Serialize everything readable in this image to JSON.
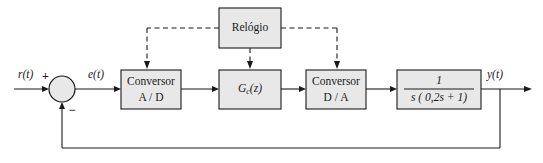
{
  "diagram": {
    "language": "pt-BR",
    "colors": {
      "block_fill": "#e8e8e8",
      "stroke": "#1a1a1a",
      "background": "#ffffff"
    },
    "signals": {
      "input": "r(t)",
      "error": "e(t)",
      "output": "y(t)"
    },
    "summing_junction": {
      "name": "somador",
      "plus_sign": "+",
      "minus_sign": "−"
    },
    "blocks": [
      {
        "id": "clock",
        "line1": "Relógio",
        "line2": ""
      },
      {
        "id": "adc",
        "line1": "Conversor",
        "line2": "A / D"
      },
      {
        "id": "controller",
        "line1": "G",
        "subscript": "c",
        "line2": "(z)"
      },
      {
        "id": "dac",
        "line1": "Conversor",
        "line2": "D / A"
      },
      {
        "id": "plant",
        "numerator": "1",
        "denominator": "s ( 0,2s + 1)"
      }
    ]
  }
}
